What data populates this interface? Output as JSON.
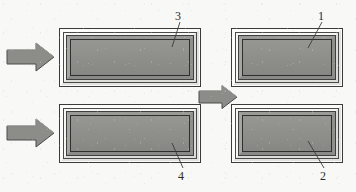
{
  "figure": {
    "type": "technical-line-drawing",
    "background_color": "#f7f7f5",
    "panel_fill_color": "#8e8e8b",
    "line_color": "#2f2f2f",
    "arrow_fill_color": "#8c8c89",
    "arrow_outline_color": "#4a4a4a"
  },
  "callouts": [
    {
      "id": "3",
      "label": "3",
      "target": "top-left-panel"
    },
    {
      "id": "1",
      "label": "1",
      "target": "top-right-panel"
    },
    {
      "id": "4",
      "label": "4",
      "target": "bottom-left-panel"
    },
    {
      "id": "2",
      "label": "2",
      "target": "bottom-right-panel"
    }
  ],
  "panels": [
    {
      "id": "frame-3",
      "reference_numeral": "3",
      "position": "top-left",
      "shape": "beveled-rectangular-frame",
      "orientation": "landscape-wide"
    },
    {
      "id": "frame-1",
      "reference_numeral": "1",
      "position": "top-right",
      "shape": "beveled-rectangular-frame",
      "orientation": "landscape"
    },
    {
      "id": "frame-4",
      "reference_numeral": "4",
      "position": "bottom-left",
      "shape": "beveled-rectangular-frame",
      "orientation": "landscape-wide"
    },
    {
      "id": "frame-2",
      "reference_numeral": "2",
      "position": "bottom-right",
      "shape": "beveled-rectangular-frame",
      "orientation": "landscape"
    }
  ],
  "arrows": [
    {
      "id": "arrow-in-top",
      "direction": "right",
      "role": "input-to-top-row"
    },
    {
      "id": "arrow-in-bottom",
      "direction": "right",
      "role": "input-to-bottom-row"
    },
    {
      "id": "arrow-mid",
      "direction": "right",
      "role": "left-column-to-right-column"
    }
  ]
}
